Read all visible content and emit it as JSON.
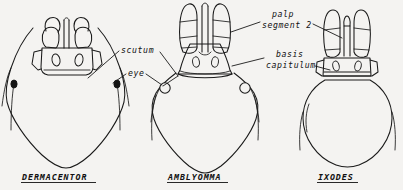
{
  "figure": {
    "background_color": "#f4f3f1",
    "ink_color": "#1a1a1a",
    "width": 403,
    "height": 190
  },
  "callouts": [
    {
      "id": "scutum",
      "line1": "scutum",
      "line2": "",
      "target": "dermacentor-scutum"
    },
    {
      "id": "eye",
      "line1": "eye",
      "line2": "",
      "target": "dermacentor-eye"
    },
    {
      "id": "palp-segment-2",
      "line1": "palp",
      "line2": "segment 2",
      "target": "palp-second-segment"
    },
    {
      "id": "basis-capituli",
      "line1": "basis",
      "line2": "capitulum",
      "target": "basis-capituli"
    }
  ],
  "specimens": [
    {
      "id": "dermacentor",
      "genus": "DERMACENTOR",
      "eyes": "present-dark",
      "palps": "short",
      "basis": "rectangular"
    },
    {
      "id": "amblyomma",
      "genus": "AMBLYOMMA",
      "eyes": "present-open",
      "palps": "long",
      "basis": "flared"
    },
    {
      "id": "ixodes",
      "genus": "IXODES",
      "eyes": "absent",
      "palps": "medium",
      "basis": "rectangular"
    }
  ]
}
